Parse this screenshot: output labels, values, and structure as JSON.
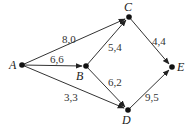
{
  "nodes": [
    {
      "id": "A",
      "label": "A",
      "x": 22,
      "y": 65
    },
    {
      "id": "B",
      "label": "B",
      "x": 86,
      "y": 66
    },
    {
      "id": "C",
      "label": "C",
      "x": 129,
      "y": 17
    },
    {
      "id": "D",
      "label": "D",
      "x": 128,
      "y": 110
    },
    {
      "id": "E",
      "label": "E",
      "x": 172,
      "y": 67
    }
  ],
  "edges": [
    {
      "from": "A",
      "to": "C",
      "label": "8,0"
    },
    {
      "from": "A",
      "to": "B",
      "label": "6,6"
    },
    {
      "from": "A",
      "to": "D",
      "label": "3,3"
    },
    {
      "from": "B",
      "to": "C",
      "label": "5,4"
    },
    {
      "from": "B",
      "to": "D",
      "label": "6,2"
    },
    {
      "from": "C",
      "to": "E",
      "label": "4,4"
    },
    {
      "from": "D",
      "to": "E",
      "label": "9,5"
    }
  ]
}
